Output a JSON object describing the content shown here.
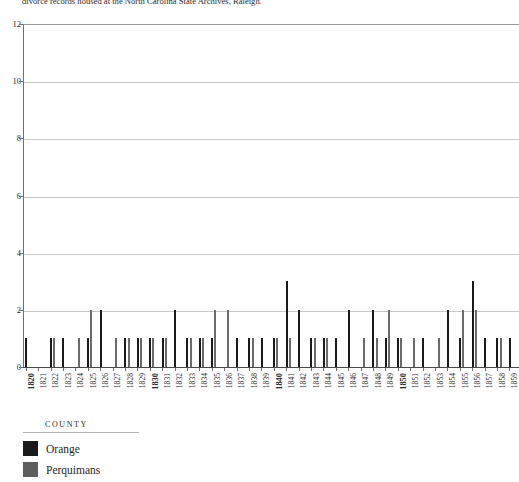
{
  "caption": {
    "text": "divorce records housed at the North Carolina State Archives, Raleigh."
  },
  "colors": {
    "orange_county": "#1a1a1a",
    "perquimans_county": "#6b6b6b",
    "gridline": "#c9c9c9",
    "axis": "#6f6f6f",
    "background": "#ffffff"
  },
  "legend": {
    "title": "COUNTY",
    "items": [
      {
        "label": "Orange",
        "color": "#1a1a1a"
      },
      {
        "label": "Perquimans",
        "color": "#5e5e5e"
      }
    ]
  },
  "chart_data": {
    "type": "bar",
    "title": "",
    "subtitle": "",
    "xlabel": "",
    "ylabel": "",
    "ylim": [
      0,
      12
    ],
    "yticks": [
      0,
      2,
      4,
      6,
      8,
      10,
      12
    ],
    "grid": true,
    "legend_position": "bottom-left",
    "legend_title": "COUNTY",
    "bar_mode": "grouped",
    "emphasized_xticks": [
      "1820",
      "1830",
      "1840",
      "1850"
    ],
    "categories": [
      "1820",
      "1821",
      "1822",
      "1823",
      "1824",
      "1825",
      "1826",
      "1827",
      "1828",
      "1829",
      "1830",
      "1831",
      "1832",
      "1833",
      "1834",
      "1835",
      "1836",
      "1837",
      "1838",
      "1839",
      "1840",
      "1841",
      "1842",
      "1843",
      "1844",
      "1845",
      "1846",
      "1847",
      "1848",
      "1849",
      "1850",
      "1851",
      "1852",
      "1853",
      "1854",
      "1855",
      "1856",
      "1857",
      "1858",
      "1859"
    ],
    "series": [
      {
        "name": "Orange",
        "color": "#1a1a1a",
        "values": [
          1,
          0,
          1,
          1,
          0,
          1,
          2,
          0,
          1,
          1,
          1,
          1,
          2,
          1,
          1,
          1,
          0,
          1,
          1,
          1,
          1,
          3,
          2,
          1,
          1,
          1,
          2,
          0,
          2,
          1,
          1,
          0,
          1,
          0,
          2,
          1,
          3,
          1,
          1,
          1
        ]
      },
      {
        "name": "Perquimans",
        "color": "#6b6b6b",
        "values": [
          0,
          0,
          1,
          0,
          1,
          2,
          0,
          1,
          1,
          1,
          1,
          1,
          0,
          1,
          1,
          2,
          2,
          0,
          1,
          0,
          1,
          1,
          0,
          1,
          1,
          0,
          0,
          1,
          1,
          2,
          1,
          1,
          0,
          1,
          0,
          2,
          2,
          0,
          1,
          0
        ]
      }
    ]
  }
}
